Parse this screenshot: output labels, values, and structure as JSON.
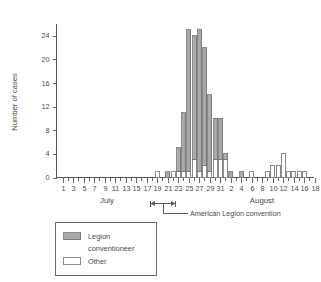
{
  "chart_data": {
    "type": "bar",
    "title": "",
    "subtitle": "",
    "xlabel": "",
    "ylabel": "Number of cases",
    "ylim": [
      0,
      26
    ],
    "y_ticks": [
      0,
      4,
      8,
      12,
      16,
      20,
      24
    ],
    "grid": false,
    "legend_position": "below-left",
    "stacked": true,
    "x_axis": {
      "month_labels": [
        "July",
        "August"
      ],
      "july_ticks": [
        1,
        3,
        5,
        7,
        9,
        11,
        13,
        15,
        17,
        19,
        21,
        23,
        25,
        27,
        29,
        31
      ],
      "august_ticks": [
        2,
        4,
        6,
        8,
        10,
        12,
        14,
        16,
        18
      ],
      "july_days": [
        1,
        2,
        3,
        4,
        5,
        6,
        7,
        8,
        9,
        10,
        11,
        12,
        13,
        14,
        15,
        16,
        17,
        18,
        19,
        20,
        21,
        22,
        23,
        24,
        25,
        26,
        27,
        28,
        29,
        30,
        31
      ],
      "august_days": [
        1,
        2,
        3,
        4,
        5,
        6,
        7,
        8,
        9,
        10,
        11,
        12,
        13,
        14,
        15,
        16,
        17,
        18
      ]
    },
    "categories": [
      "Jul 1",
      "Jul 2",
      "Jul 3",
      "Jul 4",
      "Jul 5",
      "Jul 6",
      "Jul 7",
      "Jul 8",
      "Jul 9",
      "Jul 10",
      "Jul 11",
      "Jul 12",
      "Jul 13",
      "Jul 14",
      "Jul 15",
      "Jul 16",
      "Jul 17",
      "Jul 18",
      "Jul 19",
      "Jul 20",
      "Jul 21",
      "Jul 22",
      "Jul 23",
      "Jul 24",
      "Jul 25",
      "Jul 26",
      "Jul 27",
      "Jul 28",
      "Jul 29",
      "Jul 30",
      "Jul 31",
      "Aug 1",
      "Aug 2",
      "Aug 3",
      "Aug 4",
      "Aug 5",
      "Aug 6",
      "Aug 7",
      "Aug 8",
      "Aug 9",
      "Aug 10",
      "Aug 11",
      "Aug 12",
      "Aug 13",
      "Aug 14",
      "Aug 15",
      "Aug 16",
      "Aug 17",
      "Aug 18"
    ],
    "series": [
      {
        "name": "Legion conventioneer",
        "color": "#a9a9a9",
        "values": [
          0,
          0,
          0,
          0,
          0,
          0,
          0,
          0,
          0,
          0,
          0,
          0,
          0,
          0,
          0,
          0,
          0,
          0,
          0,
          0,
          1,
          0,
          4,
          10,
          24,
          21,
          24,
          20,
          13,
          7,
          7,
          1,
          1,
          0,
          1,
          0,
          0,
          0,
          0,
          0,
          0,
          0,
          0,
          0,
          0,
          0,
          0,
          0,
          0
        ]
      },
      {
        "name": "Other",
        "color": "#ffffff",
        "values": [
          0,
          0,
          0,
          0,
          0,
          0,
          0,
          0,
          0,
          0,
          0,
          0,
          0,
          0,
          0,
          0,
          0,
          0,
          1,
          0,
          0,
          1,
          1,
          1,
          1,
          3,
          1,
          2,
          1,
          3,
          3,
          3,
          0,
          0,
          0,
          0,
          1,
          0,
          0,
          1,
          2,
          2,
          4,
          1,
          1,
          1,
          1,
          0,
          0
        ]
      }
    ],
    "totals": [
      0,
      0,
      0,
      0,
      0,
      0,
      0,
      0,
      0,
      0,
      0,
      0,
      0,
      0,
      0,
      0,
      0,
      0,
      1,
      0,
      1,
      1,
      5,
      11,
      25,
      24,
      25,
      22,
      14,
      10,
      10,
      4,
      1,
      0,
      1,
      0,
      1,
      0,
      0,
      1,
      2,
      2,
      4,
      1,
      1,
      1,
      1,
      0,
      0
    ],
    "annotations": [
      {
        "name": "american-legion-convention",
        "label": "American Legion convention",
        "start": "Jul 21",
        "end": "Jul 24"
      }
    ]
  },
  "legend": {
    "items": [
      {
        "label_line1": "Legion",
        "label_line2": "conventioneer",
        "color": "#a9a9a9"
      },
      {
        "label_line1": "Other",
        "label_line2": "",
        "color": "#ffffff"
      }
    ]
  },
  "colors": {
    "conventioneer": "#a9a9a9",
    "other": "#ffffff",
    "outline": "#6e6e6e",
    "axis": "#555555",
    "text": "#4a4a4a"
  }
}
